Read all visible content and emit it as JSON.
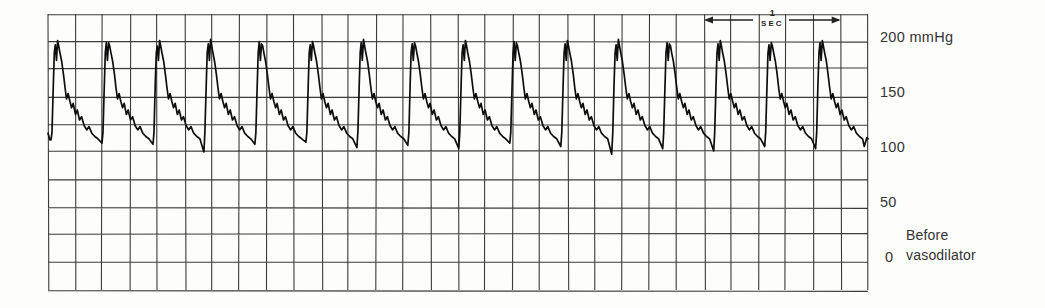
{
  "figure": {
    "y_ticks": [
      {
        "value": 200,
        "label": "200 mmHg"
      },
      {
        "value": 150,
        "label": "150"
      },
      {
        "value": 100,
        "label": "100"
      },
      {
        "value": 50,
        "label": "50"
      },
      {
        "value": 0,
        "label": "0"
      }
    ],
    "time_marker": {
      "top": "1",
      "bottom": "SEC"
    },
    "caption": {
      "line1": "Before",
      "line2": "vasodilator"
    },
    "colors": {
      "ink": "#222222",
      "grid": "#2a2a2a",
      "trace": "#0e0e0e",
      "paper": "#fdfdfb",
      "text": "#333333"
    }
  },
  "chart_data": {
    "type": "line",
    "ylabel": "Pressure (mmHg)",
    "xlabel": "Time",
    "ylim": [
      -25,
      225
    ],
    "y_ticks": [
      0,
      50,
      100,
      150,
      200
    ],
    "grid": {
      "rows": 10,
      "cols": 30,
      "mmHg_per_cell": 25,
      "seconds_per_cell": 0.2
    },
    "time_marker_seconds": 1,
    "time_marker_span_cells": 5,
    "systolic_mmHg_approx": 200,
    "diastolic_mmHg_approx": 105,
    "beats_per_minute_approx": 160,
    "beat_period_seconds": 0.373,
    "n_beats": 16,
    "peak_point_indexes": [
      4,
      6
    ],
    "beat_template_phase_mmHg": [
      [
        0.0,
        109
      ],
      [
        0.02,
        118
      ],
      [
        0.045,
        160
      ],
      [
        0.065,
        190
      ],
      [
        0.085,
        199
      ],
      [
        0.107,
        183
      ],
      [
        0.13,
        200
      ],
      [
        0.152,
        196
      ],
      [
        0.175,
        190
      ],
      [
        0.21,
        182
      ],
      [
        0.245,
        170
      ],
      [
        0.276,
        158
      ],
      [
        0.305,
        148
      ],
      [
        0.336,
        153
      ],
      [
        0.37,
        146
      ],
      [
        0.405,
        140
      ],
      [
        0.436,
        144
      ],
      [
        0.48,
        134
      ],
      [
        0.515,
        138
      ],
      [
        0.56,
        129
      ],
      [
        0.6,
        132
      ],
      [
        0.65,
        124
      ],
      [
        0.7,
        120
      ],
      [
        0.746,
        123
      ],
      [
        0.8,
        117
      ],
      [
        0.86,
        114
      ],
      [
        0.92,
        112
      ]
    ],
    "beats": [
      {
        "trough_mmHg": 111,
        "peak1_delta": -2,
        "peak2_delta": 1
      },
      {
        "trough_mmHg": 108,
        "peak1_delta": 0,
        "peak2_delta": -1
      },
      {
        "trough_mmHg": 107,
        "peak1_delta": -3,
        "peak2_delta": 1
      },
      {
        "trough_mmHg": 100,
        "peak1_delta": -1,
        "peak2_delta": 2
      },
      {
        "trough_mmHg": 107,
        "peak1_delta": 1,
        "peak2_delta": -2
      },
      {
        "trough_mmHg": 109,
        "peak1_delta": -2,
        "peak2_delta": 0
      },
      {
        "trough_mmHg": 104,
        "peak1_delta": 0,
        "peak2_delta": 2
      },
      {
        "trough_mmHg": 106,
        "peak1_delta": -1,
        "peak2_delta": -1
      },
      {
        "trough_mmHg": 103,
        "peak1_delta": -2,
        "peak2_delta": 1
      },
      {
        "trough_mmHg": 108,
        "peak1_delta": 1,
        "peak2_delta": -1
      },
      {
        "trough_mmHg": 105,
        "peak1_delta": -1,
        "peak2_delta": 1
      },
      {
        "trough_mmHg": 98,
        "peak1_delta": -2,
        "peak2_delta": 2
      },
      {
        "trough_mmHg": 103,
        "peak1_delta": 0,
        "peak2_delta": -2
      },
      {
        "trough_mmHg": 101,
        "peak1_delta": -1,
        "peak2_delta": 1
      },
      {
        "trough_mmHg": 105,
        "peak1_delta": -2,
        "peak2_delta": -1
      },
      {
        "trough_mmHg": 103,
        "peak1_delta": 0,
        "peak2_delta": 1
      }
    ],
    "lead_in_phase_mmHg": [
      [
        -0.059,
        117
      ],
      [
        -0.02,
        111
      ]
    ],
    "tail_phase_mmHg": [
      [
        0.955,
        105
      ],
      [
        1.005,
        113
      ],
      [
        1.04,
        112
      ]
    ]
  }
}
